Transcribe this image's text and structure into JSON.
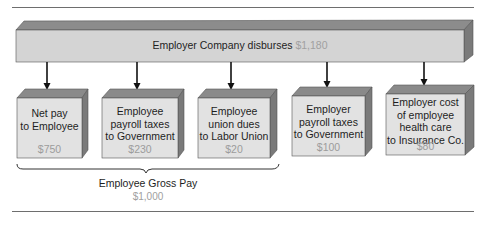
{
  "diagram": {
    "source": {
      "label": "Employer Company disburses",
      "amount": "$1,180"
    },
    "boxes": [
      {
        "lines": [
          "Net pay",
          "to Employee"
        ],
        "amount": "$750"
      },
      {
        "lines": [
          "Employee",
          "payroll taxes",
          "to Government"
        ],
        "amount": "$230"
      },
      {
        "lines": [
          "Employee",
          "union dues",
          "to Labor Union"
        ],
        "amount": "$20"
      },
      {
        "lines": [
          "Employer",
          "payroll taxes",
          "to Government"
        ],
        "amount": "$100"
      },
      {
        "lines": [
          "Employer cost",
          "of employee",
          "health care",
          "to Insurance Co."
        ],
        "amount": "$80"
      }
    ],
    "group": {
      "label": "Employee Gross Pay",
      "amount": "$1,000",
      "covers_boxes": [
        0,
        1,
        2
      ]
    },
    "colors": {
      "front_face": "#d4d4d4",
      "box_front_face": "#e2e2e2",
      "top_face": "#8a8a8a",
      "side_face": "#7a7a7a",
      "amount_text": "#a0a0a0",
      "arrow": "#111111"
    }
  }
}
